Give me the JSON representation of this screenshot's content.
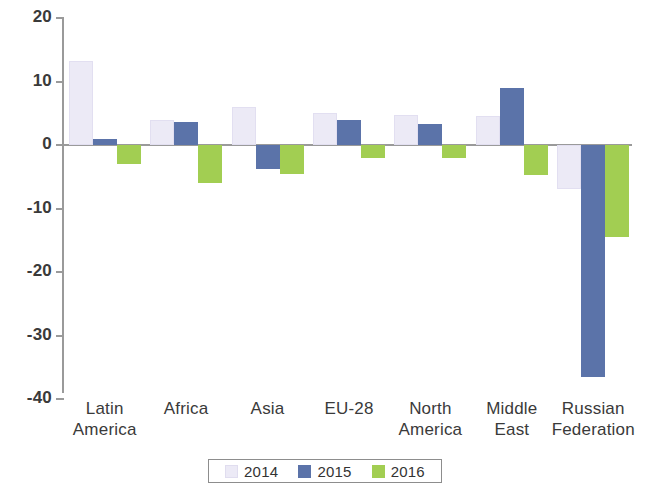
{
  "chart_data": {
    "type": "bar",
    "title": "",
    "subtitle": "",
    "xlabel": "",
    "ylabel": "",
    "ylim": [
      -40,
      20
    ],
    "ytick_values": [
      20,
      10,
      0,
      -10,
      -20,
      -30,
      -40
    ],
    "ytick_labels": [
      "20",
      "10",
      "0",
      "-10",
      "-20",
      "-30",
      "-40"
    ],
    "grid": false,
    "zero_line": true,
    "legend_position": "bottom",
    "categories": [
      "Latin\nAmerica",
      "Africa",
      "Asia",
      "EU-28",
      "North\nAmerica",
      "Middle\nEast",
      "Russian\nFederation"
    ],
    "category_labels": [
      {
        "line1": "Latin",
        "line2": "America"
      },
      {
        "line1": "Africa",
        "line2": ""
      },
      {
        "line1": "Asia",
        "line2": ""
      },
      {
        "line1": "EU-28",
        "line2": ""
      },
      {
        "line1": "North",
        "line2": "America"
      },
      {
        "line1": "Middle",
        "line2": "East"
      },
      {
        "line1": "Russian",
        "line2": "Federation"
      }
    ],
    "series": [
      {
        "name": "2014",
        "color": "#eceaf6",
        "values": [
          13.3,
          4.0,
          6.0,
          5.0,
          4.8,
          4.5,
          -7.0
        ]
      },
      {
        "name": "2015",
        "color": "#5b73a9",
        "values": [
          1.0,
          3.7,
          -3.8,
          4.0,
          3.3,
          9.0,
          -36.5
        ]
      },
      {
        "name": "2016",
        "color": "#a2ce52",
        "values": [
          -3.0,
          -6.0,
          -4.5,
          -2.0,
          -2.0,
          -4.7,
          -14.5
        ]
      }
    ]
  },
  "legend": {
    "items": [
      {
        "label": "2014",
        "color": "#eceaf6"
      },
      {
        "label": "2015",
        "color": "#5b73a9"
      },
      {
        "label": "2016",
        "color": "#a2ce52"
      }
    ]
  }
}
